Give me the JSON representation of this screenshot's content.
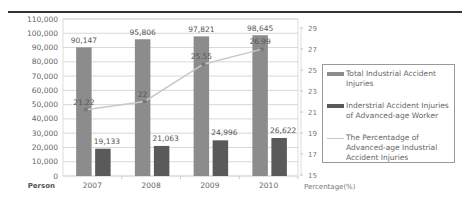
{
  "chart_data": {
    "type": "bar",
    "title": "",
    "xlabel": "",
    "ylabel": "Person",
    "y2label": "Percentage(%)",
    "categories": [
      "2007",
      "2008",
      "2009",
      "2010"
    ],
    "ylim": [
      0,
      110000
    ],
    "y_ticks": [
      "110,000",
      "100,000",
      "90,000",
      "80,000",
      "70,000",
      "60,000",
      "50,000",
      "40,000",
      "30,000",
      "20,000",
      "10,000",
      "0"
    ],
    "y2lim": [
      15,
      29
    ],
    "y2_ticks": [
      "29",
      "27",
      "25",
      "23",
      "21",
      "19",
      "17",
      "15"
    ],
    "grid": true,
    "legend_position": "right",
    "series": [
      {
        "name": "Total Industrial Accident Injuries",
        "type": "bar",
        "axis": "left",
        "color": "#8c8c8c",
        "values": [
          90147,
          95806,
          97821,
          98645
        ],
        "labels": [
          "90,147",
          "95,806",
          "97,821",
          "98,645"
        ]
      },
      {
        "name": "Inderstrial Accident Injuries of Advanced-age Worker",
        "type": "bar",
        "axis": "left",
        "color": "#5a5a5a",
        "values": [
          19133,
          21063,
          24996,
          26622
        ],
        "labels": [
          "19,133",
          "21,063",
          "24,996",
          "26,622"
        ]
      },
      {
        "name": "The Percentadge of Advanced-age Industrial Accident Injuries",
        "type": "line",
        "axis": "right",
        "color": "#c8c8c8",
        "values": [
          21.22,
          22,
          25.55,
          26.99
        ],
        "labels": [
          "21.22",
          "22",
          "25.55",
          "26.99"
        ]
      }
    ]
  },
  "legend": {
    "items": [
      {
        "label": "Total Industrial Accident Injuries",
        "color": "#8c8c8c"
      },
      {
        "label": "Inderstrial Accident Injuries of Advanced-age Worker",
        "color": "#5a5a5a"
      },
      {
        "label": "The Percentadge of Advanced-age Industrial Accident Injuries",
        "color": "#c8c8c8"
      }
    ]
  }
}
